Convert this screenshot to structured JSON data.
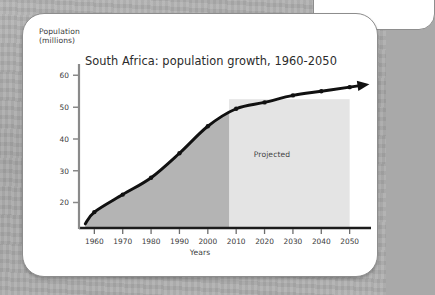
{
  "page": {
    "background_color": "#a9a9a9",
    "card_background": "#ffffff",
    "card_border_color": "#8d8d8d"
  },
  "chart_data": {
    "type": "line",
    "title": "South Africa: population growth, 1960-2050",
    "xlabel": "Years",
    "ylabel": "Population\n(millions)",
    "ylabel_line1": "Population",
    "ylabel_line2": "(millions)",
    "x": [
      1960,
      1970,
      1980,
      1990,
      2000,
      2010,
      2020,
      2030,
      2040,
      2050
    ],
    "values": [
      17.0,
      22.5,
      27.8,
      35.5,
      44.0,
      49.5,
      51.5,
      53.7,
      55.0,
      56.3
    ],
    "x_tick_labels": [
      "1960",
      "1970",
      "1980",
      "1990",
      "2000",
      "2010",
      "2020",
      "2030",
      "2040",
      "2050"
    ],
    "y_tick_labels": [
      "20",
      "30",
      "40",
      "50",
      "60"
    ],
    "y_ticks": [
      20,
      30,
      40,
      50,
      60
    ],
    "xlim": [
      1956,
      2054
    ],
    "ylim": [
      12,
      62
    ],
    "grid": false,
    "legend": "none",
    "annotations": [
      {
        "text": "Projected",
        "x": 2029,
        "y": 32
      }
    ],
    "series_color": "#111111",
    "marker": "dot",
    "arrow_end": true,
    "regions": [
      {
        "name": "historical",
        "from": 1956,
        "to": 2007.5,
        "color": "#b4b4b4",
        "under_curve": true
      },
      {
        "name": "projected",
        "from": 2007.5,
        "to": 2050,
        "color": "#e4e4e4",
        "under_curve": false
      }
    ]
  }
}
